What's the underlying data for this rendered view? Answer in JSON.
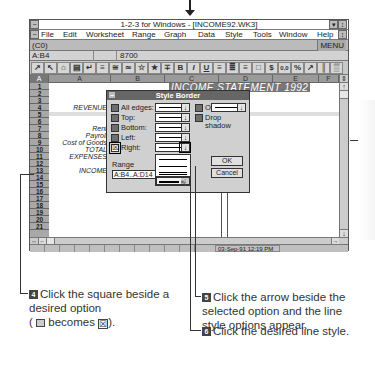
{
  "window": {
    "title": "1-2-3 for Windows - [INCOME92.WK3]",
    "control_minimize": "▾",
    "control_restore": "↕"
  },
  "menubar": {
    "items": [
      "File",
      "Edit",
      "Worksheet",
      "Range",
      "Graph",
      "Data",
      "Style",
      "Tools",
      "Window",
      "Help"
    ]
  },
  "format_line": {
    "format": "(C0)",
    "mode": "MENU"
  },
  "edit_line": {
    "address": "A:B4",
    "contents": "8700"
  },
  "toolbar": {
    "icons": [
      "↗",
      "↖",
      "⌂",
      "▤",
      "↵",
      "≡",
      "≅",
      "≃",
      "☆",
      "★",
      "∓",
      "B",
      "I",
      "U",
      "≡",
      "≣",
      "≡",
      "□",
      "$",
      "0,0",
      "%",
      "↗",
      "║",
      "▒",
      "↗",
      "↘"
    ]
  },
  "sheet": {
    "sheet_letter": "A",
    "columns": [
      "A",
      "B",
      "C",
      "D",
      "E",
      "F"
    ],
    "rows": [
      "1",
      "2",
      "3",
      "4",
      "5",
      "6",
      "7",
      "8",
      "9",
      "10",
      "11",
      "12",
      "13",
      "14",
      "15",
      "16",
      "17",
      "18",
      "19",
      "20",
      "21"
    ],
    "title_cell": "INCOME STATEMENT 1992",
    "labels": {
      "revenue": "REVENUE",
      "rent": "Rent",
      "payroll": "Payroll",
      "cost_of_goods": "Cost of Goods",
      "total_expenses": "TOTAL EXPENSES",
      "income": "INCOME"
    }
  },
  "statusbar": {
    "datetime": "03-Sep-91 12:19 PM"
  },
  "dialog": {
    "title": "Style Border",
    "options": [
      {
        "label": "All edges:",
        "checked": false
      },
      {
        "label": "Top:",
        "checked": false
      },
      {
        "label": "Bottom:",
        "checked": false
      },
      {
        "label": "Left:",
        "checked": false
      },
      {
        "label": "Right:",
        "checked": true
      }
    ],
    "outline_label": "Outline:",
    "drop_shadow_label": "Drop shadow",
    "range_label": "Range",
    "range_value": "A:B4..A:D14",
    "ok_label": "OK",
    "cancel_label": "Cancel",
    "checked_glyph": "☒",
    "dropdown_glyph": "↓"
  },
  "captions": {
    "step4_num": "4",
    "step4_text": "Click the square beside a desired option",
    "step4_paren_open": "(",
    "step4_becomes": "becomes",
    "step4_paren_close": ").",
    "step4_checked_glyph": "☒",
    "step5_num": "5",
    "step5_text": "Click the arrow beside the selected option and the line style options appear.",
    "step6_num": "6",
    "step6_text": "Click the desired line style."
  }
}
